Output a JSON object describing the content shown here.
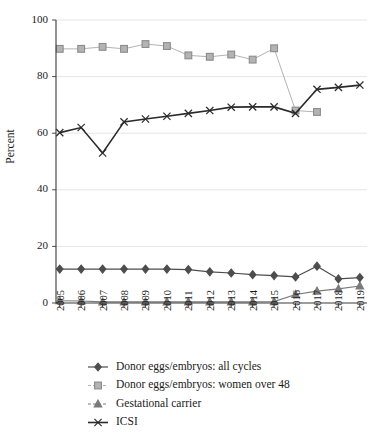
{
  "chart_data": {
    "type": "line",
    "title": "",
    "xlabel": "",
    "ylabel": "Percent",
    "x": [
      "2005",
      "2006",
      "2007",
      "2008",
      "2009",
      "2010",
      "2011",
      "2012",
      "2013",
      "2014",
      "2015",
      "2016",
      "2017",
      "2018",
      "2019"
    ],
    "ylim": [
      0,
      100
    ],
    "yticks": [
      "0",
      "20",
      "40",
      "60",
      "80",
      "100"
    ],
    "grid": true,
    "legend_position": "bottom",
    "series": [
      {
        "name": "Donor eggs/embryos: all cycles",
        "marker": "diamond",
        "color": "#4d4d4d",
        "values": [
          12.0,
          12.0,
          12.0,
          12.0,
          12.0,
          12.0,
          11.8,
          11.0,
          10.6,
          10.0,
          9.7,
          9.2,
          13.0,
          8.5,
          9.0
        ]
      },
      {
        "name": "Donor eggs/embryos: women over 48",
        "marker": "square",
        "color": "#b3b3b3",
        "values": [
          89.8,
          89.8,
          90.5,
          89.8,
          91.5,
          90.8,
          87.5,
          87.0,
          87.8,
          86.0,
          90.0,
          68.0,
          67.5,
          null,
          null
        ]
      },
      {
        "name": "Gestational carrier",
        "marker": "triangle",
        "color": "#7a7a7a",
        "values": [
          0.8,
          0.7,
          0.4,
          0.4,
          0.4,
          0.4,
          0.4,
          0.4,
          0.4,
          0.4,
          0.5,
          3.0,
          4.2,
          5.0,
          6.0
        ]
      },
      {
        "name": "ICSI",
        "marker": "cross",
        "color": "#2b2b2b",
        "values": [
          60.2,
          62.0,
          53.0,
          64.0,
          65.0,
          66.0,
          67.0,
          68.0,
          69.2,
          69.3,
          69.3,
          67.0,
          75.5,
          76.2,
          77.0
        ]
      }
    ]
  }
}
